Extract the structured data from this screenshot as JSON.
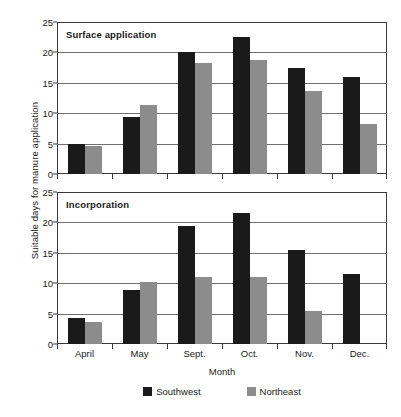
{
  "chart_data": {
    "type": "bar",
    "title": "",
    "xlabel": "Month",
    "ylabel": "Suitable days for manure application",
    "categories": [
      "April",
      "May",
      "Sept.",
      "Oct.",
      "Nov.",
      "Dec."
    ],
    "ylim": [
      0,
      25
    ],
    "yticks": [
      0,
      5,
      10,
      15,
      20,
      25
    ],
    "grid": true,
    "legend_position": "bottom-center",
    "legend": [
      {
        "name": "Southwest",
        "color": "#1a1a1a"
      },
      {
        "name": "Northeast",
        "color": "#8c8c8c"
      }
    ],
    "panels": [
      {
        "title": "Surface application",
        "series": [
          {
            "name": "Southwest",
            "color": "#1a1a1a",
            "values": [
              4.9,
              9.3,
              20.0,
              22.6,
              17.5,
              16.0
            ]
          },
          {
            "name": "Northeast",
            "color": "#8c8c8c",
            "values": [
              4.6,
              11.4,
              18.2,
              18.8,
              13.6,
              8.3
            ]
          }
        ]
      },
      {
        "title": "Incorporation",
        "series": [
          {
            "name": "Southwest",
            "color": "#1a1a1a",
            "values": [
              4.2,
              8.9,
              19.4,
              21.5,
              15.5,
              11.5
            ]
          },
          {
            "name": "Northeast",
            "color": "#8c8c8c",
            "values": [
              3.6,
              10.2,
              11.1,
              11.0,
              5.4,
              null
            ]
          }
        ]
      }
    ]
  }
}
